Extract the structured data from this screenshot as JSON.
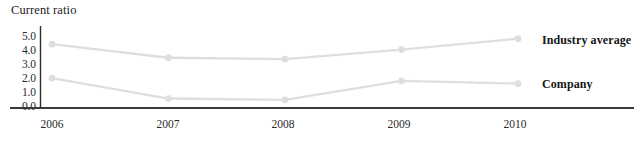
{
  "chart_data": {
    "type": "line",
    "title": "Current ratio",
    "xlabel": "",
    "ylabel": "",
    "categories": [
      "2006",
      "2007",
      "2008",
      "2009",
      "2010"
    ],
    "ylim": [
      0.0,
      5.0
    ],
    "yticks": [
      "5.0",
      "4.0",
      "3.0",
      "2.0",
      "1.0",
      "0.0"
    ],
    "ytick_values": [
      5.0,
      4.0,
      3.0,
      2.0,
      1.0,
      0.0
    ],
    "grid": false,
    "legend_position": "right-inline",
    "series": [
      {
        "name": "Industry average",
        "values": [
          4.4,
          3.4,
          3.3,
          4.0,
          4.8
        ],
        "color": "#dedede",
        "marker": "circle",
        "last_segment_style": "dotted"
      },
      {
        "name": "Company",
        "values": [
          1.9,
          0.4,
          0.3,
          1.7,
          1.5
        ],
        "color": "#dedede",
        "marker": "circle",
        "last_segment_style": "dotted"
      }
    ]
  },
  "axes": {
    "axis_color": "#3a3a3a",
    "y_axis_color": "#2b2b2b"
  },
  "labels": {
    "y0": "5.0",
    "y1": "4.0",
    "y2": "3.0",
    "y3": "2.0",
    "y4": "1.0",
    "y5": "0.0",
    "x0": "2006",
    "x1": "2007",
    "x2": "2008",
    "x3": "2009",
    "x4": "2010",
    "series0": "Industry average",
    "series1": "Company"
  }
}
